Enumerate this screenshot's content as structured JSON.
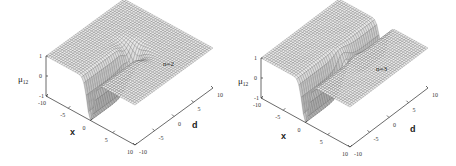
{
  "chart_data": [
    {
      "type": "surface",
      "title": "",
      "annotation": "n=2",
      "n": 2,
      "xlabel": "x",
      "ylabel": "d",
      "zlabel_main": "μ",
      "zlabel_sub": "12",
      "xlim": [
        -10,
        10
      ],
      "ylim": [
        -10,
        10
      ],
      "zlim": [
        -1,
        1
      ],
      "xticks": [
        "-10",
        "-5",
        "0",
        "5",
        "10"
      ],
      "yticks": [
        "-10",
        "-5",
        "0",
        "5",
        "10"
      ],
      "zticks": [
        "-1",
        "0",
        "1"
      ],
      "description": "Surface equals 1 across most of the domain with a deep trough (down to -1) along x ≈ 0 for d < 0, and a ridge/valley structure near d ≈ 0"
    },
    {
      "type": "surface",
      "title": "",
      "annotation": "n=3",
      "n": 3,
      "xlabel": "x",
      "ylabel": "d",
      "zlabel_main": "μ",
      "zlabel_sub": "12",
      "xlim": [
        -10,
        10
      ],
      "ylim": [
        -10,
        10
      ],
      "zlim": [
        -1,
        1
      ],
      "xticks": [
        "-10",
        "-5",
        "0",
        "5",
        "10"
      ],
      "yticks": [
        "-10",
        "-5",
        "0",
        "5",
        "10"
      ],
      "zticks": [
        "-1",
        "0",
        "1"
      ],
      "description": "Surface equals 1 across most of the domain with two troughs along x ≈ 0: one for d > 0 and one for d < 0, meeting near d ≈ 0"
    }
  ]
}
